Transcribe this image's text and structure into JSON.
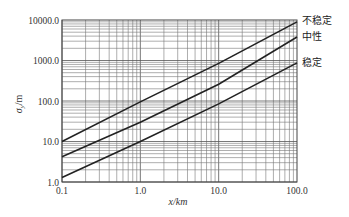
{
  "chart_data": {
    "type": "line",
    "title": "",
    "xlabel": "x/km",
    "ylabel": "σy/m",
    "xscale": "log",
    "yscale": "log",
    "xlim": [
      0.1,
      100.0
    ],
    "ylim": [
      1.0,
      10000.0
    ],
    "grid": true,
    "x_ticks": [
      "0.1",
      "1.0",
      "10.0",
      "100.0"
    ],
    "y_ticks": [
      "1.0",
      "10.0",
      "100.0",
      "1000.0",
      "10000.0"
    ],
    "x": [
      0.1,
      1.0,
      10.0,
      100.0
    ],
    "series": [
      {
        "name": "不稳定",
        "values": [
          10,
          95,
          850,
          9000
        ]
      },
      {
        "name": "中性",
        "values": [
          4.2,
          30,
          260,
          3800
        ]
      },
      {
        "name": "稳定",
        "values": [
          1.3,
          10,
          85,
          870
        ]
      }
    ],
    "legend_position": "right (inline labels at line ends)"
  },
  "labels": {
    "xlabel": "x/km",
    "ylabel_main": "σ",
    "ylabel_sub": "y",
    "ylabel_unit": "/m",
    "series_unstable": "不稳定",
    "series_neutral": "中性",
    "series_stable": "稳定"
  }
}
